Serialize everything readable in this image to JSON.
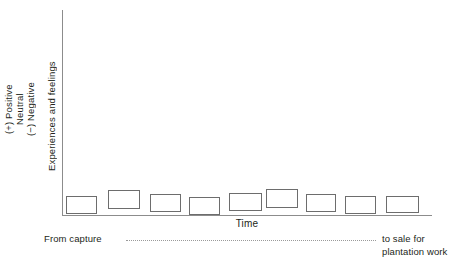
{
  "chart_data": {
    "type": "bar",
    "title": "",
    "subtitle": "",
    "xlabel": "Time",
    "ylabel": "Experiences and feelings",
    "grid": false,
    "legend": null,
    "ylim": [
      -1,
      1
    ],
    "y_tick_labels": [
      "(−) Negative",
      "Neutral",
      "(+) Positive"
    ],
    "x_tick_labels": [],
    "categories": [
      "1",
      "2",
      "3",
      "4",
      "5",
      "6",
      "7",
      "8",
      "9"
    ],
    "values": [
      -0.22,
      0.05,
      -0.08,
      -0.3,
      -0.02,
      0.14,
      -0.08,
      -0.22,
      -0.2
    ],
    "series": [
      {
        "name": "Experiences and feelings over time",
        "values": [
          -0.22,
          0.05,
          -0.08,
          -0.3,
          -0.02,
          0.14,
          -0.08,
          -0.22,
          -0.2
        ]
      }
    ],
    "boxes": [
      {
        "x": 66,
        "y": 196,
        "w": 31,
        "h": 18
      },
      {
        "x": 108,
        "y": 190,
        "w": 32,
        "h": 19
      },
      {
        "x": 150,
        "y": 194,
        "w": 31,
        "h": 18
      },
      {
        "x": 189,
        "y": 197,
        "w": 31,
        "h": 18
      },
      {
        "x": 229,
        "y": 193,
        "w": 33,
        "h": 18
      },
      {
        "x": 266,
        "y": 189,
        "w": 32,
        "h": 19
      },
      {
        "x": 306,
        "y": 194,
        "w": 30,
        "h": 18
      },
      {
        "x": 345,
        "y": 196,
        "w": 31,
        "h": 18
      },
      {
        "x": 386,
        "y": 196,
        "w": 33,
        "h": 17
      }
    ],
    "annotations": {
      "start": "From capture",
      "end_line1": "to sale for",
      "end_line2": "plantation work"
    },
    "colors": {
      "background": "#ffffff",
      "axis": "#8c8c8c",
      "box_border": "#6d6d6d",
      "box_fill": "#ffffff",
      "text": "#231f20",
      "connector": "#9a9a9a"
    }
  },
  "yaxis": {
    "title": "Experiences and feelings",
    "ticks": {
      "positive": "(+) Positive",
      "neutral": "Neutral",
      "negative": "(−) Negative"
    }
  },
  "xaxis": {
    "title": "Time"
  },
  "annotations": {
    "start": "From capture",
    "end_line1": "to sale for",
    "end_line2": "plantation work"
  }
}
